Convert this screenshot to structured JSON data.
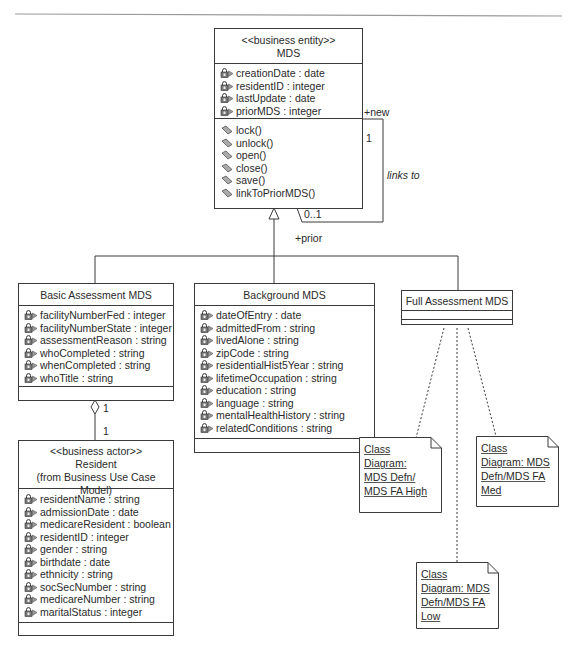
{
  "colors": {
    "line": "#3a3a3a",
    "text": "#2a2a2a",
    "background": "#ffffff",
    "rule": "#9a9a9a"
  },
  "icons": {
    "attribute": "padlock-attribute-icon",
    "operation": "operation-diamond-icon"
  },
  "classes": {
    "mds": {
      "stereotype": "<<business entity>>",
      "name": "MDS",
      "attributes": [
        "creationDate : date",
        "residentID : integer",
        "lastUpdate : date",
        "priorMDS : integer"
      ],
      "operations": [
        "lock()",
        "unlock()",
        "open()",
        "close()",
        "save()",
        "linkToPriorMDS()"
      ]
    },
    "basic": {
      "name": "Basic Assessment MDS",
      "attributes": [
        "facilityNumberFed : integer",
        "facilityNumberState : integer",
        "assessmentReason : string",
        "whoCompleted : string",
        "whenCompleted : string",
        "whoTitle : string"
      ]
    },
    "background": {
      "name": "Background MDS",
      "attributes": [
        "dateOfEntry : date",
        "admittedFrom : string",
        "livedAlone : string",
        "zipCode : string",
        "residentialHist5Year : string",
        "lifetimeOccupation : string",
        "education : string",
        "language : string",
        "mentalHealthHistory : string",
        "relatedConditions : string"
      ]
    },
    "full": {
      "name": "Full Assessment MDS"
    },
    "resident": {
      "stereotype": "<<business actor>>",
      "name": "Resident",
      "origin": "(from Business Use Case Model)",
      "attributes": [
        "residentName : string",
        "admissionDate : date",
        "medicareResident : boolean",
        "residentID : integer",
        "gender : string",
        "birthdate : date",
        "ethnicity : string",
        "socSecNumber : string",
        "medicareNumber : string",
        "maritalStatus : integer"
      ]
    }
  },
  "notes": {
    "high": [
      "Class",
      "Diagram:",
      "MDS Defn/",
      "MDS FA High"
    ],
    "med": [
      "Class",
      "Diagram: MDS",
      "Defn/MDS FA",
      "Med"
    ],
    "low": [
      "Class",
      "Diagram: MDS",
      "Defn/MDS FA",
      "Low"
    ]
  },
  "associations": {
    "self_link": {
      "role_new": "+new",
      "mult_new": "1",
      "name": "links to",
      "mult_prior": "0..1",
      "role_prior": "+prior"
    },
    "aggregation": {
      "mult_top": "1",
      "mult_bottom": "1"
    }
  }
}
